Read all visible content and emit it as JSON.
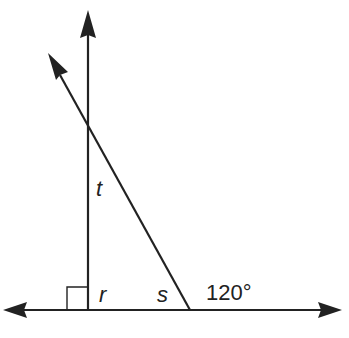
{
  "diagram": {
    "type": "geometry-angles",
    "colors": {
      "line": "#222222",
      "background": "#ffffff"
    },
    "labels": {
      "t": "t",
      "r": "r",
      "s": "s",
      "angle_value": "120°"
    },
    "elements": {
      "horizontal_line": {
        "description": "line with arrows at both ends"
      },
      "vertical_ray": {
        "description": "ray pointing up, perpendicular to horizontal line"
      },
      "transversal_ray": {
        "description": "ray pointing up-left, crossing the vertical ray"
      },
      "right_angle_marker": {
        "description": "square marking 90° between vertical ray and horizontal line"
      }
    }
  }
}
